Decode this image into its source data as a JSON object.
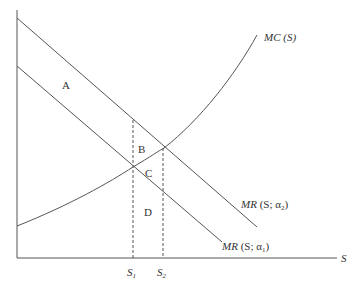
{
  "diagram": {
    "axes": {
      "x_label": "S",
      "x_ticks": [
        {
          "label": "S",
          "sub": "1"
        },
        {
          "label": "S",
          "sub": "2"
        }
      ]
    },
    "curves": {
      "mc": {
        "label": "MC",
        "arg": "(S)"
      },
      "mr_a2": {
        "label": "MR",
        "arg_open": "(S; α",
        "sub": "2",
        "arg_close": ")"
      },
      "mr_a1": {
        "label": "MR",
        "arg_open": "(S; α",
        "sub": "1",
        "arg_close": ")"
      }
    },
    "regions": {
      "a": "A",
      "b": "B",
      "c": "C",
      "d": "D"
    },
    "colors": {
      "line": "#555555",
      "text": "#333333"
    }
  }
}
